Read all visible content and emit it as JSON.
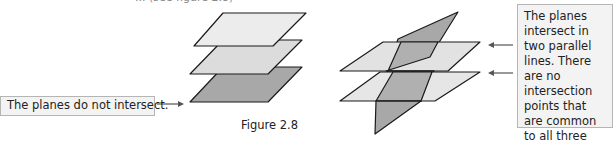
{
  "header": {
    "cutoff_text": "... (see figure 2.8)"
  },
  "figure": {
    "caption": "Figure 2.8",
    "left_diagram": {
      "description": "Three parallel stacked planes",
      "plane_count": 3
    },
    "right_diagram": {
      "description": "Two parallel horizontal planes cut by a third oblique plane",
      "plane_count": 3
    }
  },
  "annotations": {
    "left_label": "The planes do not intersect.",
    "right_label": "The planes intersect in two parallel lines. There are no intersection points that are common to all three planes."
  },
  "colors": {
    "plane_light": "#ececec",
    "plane_mid": "#dcdcdc",
    "plane_dark": "#a8a8a8",
    "outline": "#1a1a1a",
    "box_bg": "#f3f3f3",
    "box_border": "#b5b5b5"
  }
}
